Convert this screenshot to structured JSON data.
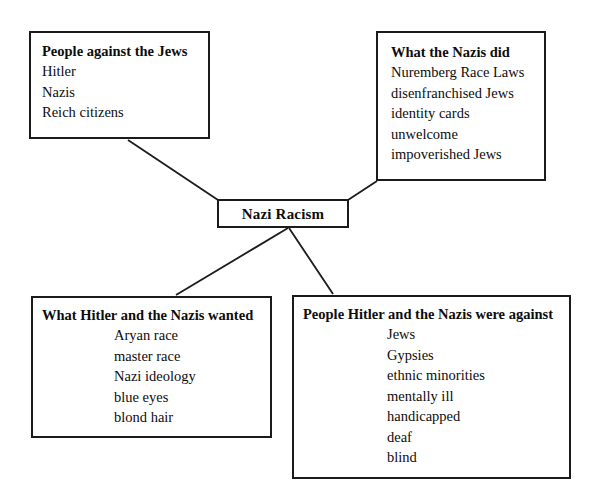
{
  "diagram": {
    "type": "concept-map",
    "center": {
      "title": "Nazi Racism"
    },
    "nodes": [
      {
        "id": "people-against",
        "title": "People against the Jews",
        "items": [
          "Hitler",
          "Nazis",
          "Reich citizens"
        ]
      },
      {
        "id": "what-nazis-did",
        "title": "What the Nazis did",
        "items": [
          "Nuremberg Race Laws",
          "disenfranchised Jews",
          "identity cards",
          "unwelcome",
          "impoverished Jews"
        ]
      },
      {
        "id": "hitler-wanted",
        "title": "What Hitler and the Nazis wanted",
        "items": [
          "Aryan race",
          "master race",
          "Nazi ideology",
          "blue eyes",
          "blond hair"
        ]
      },
      {
        "id": "people-against-list",
        "title": "People Hitler and the Nazis were against",
        "items": [
          "Jews",
          "Gypsies",
          "ethnic minorities",
          "mentally ill",
          "handicapped",
          "deaf",
          "blind"
        ]
      }
    ],
    "colors": {
      "border": "#1b1b1b",
      "text": "#0d0d0d",
      "background": "#ffffff",
      "connector": "#1b1b1b"
    }
  }
}
